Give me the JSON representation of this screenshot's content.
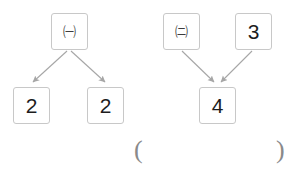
{
  "diagram": {
    "type": "arrow-decomposition-diagram",
    "colors": {
      "box_border": "#c8c8c8",
      "arrow": "#a6a6a6",
      "digit_text": "#1d1d1d",
      "circled_text": "#3c3c3c",
      "paren_text": "#8a8a8a",
      "background": "#ffffff"
    },
    "left_group": {
      "name": "left-decomposition",
      "parent": {
        "label": "㈠",
        "icon_name": "circled-korean-giyeok",
        "kind": "circled-letter"
      },
      "children": [
        {
          "label": "2",
          "kind": "digit"
        },
        {
          "label": "2",
          "kind": "digit"
        }
      ],
      "arrows": [
        {
          "from": "parent",
          "to": "child-1",
          "direction": "down-left"
        },
        {
          "from": "parent",
          "to": "child-2",
          "direction": "down-right"
        }
      ]
    },
    "right_group": {
      "name": "right-composition",
      "parents": [
        {
          "label": "㈡",
          "icon_name": "circled-korean-nieun",
          "kind": "circled-letter"
        },
        {
          "label": "3",
          "kind": "digit"
        }
      ],
      "child": {
        "label": "4",
        "kind": "digit"
      },
      "arrows": [
        {
          "from": "parent-1",
          "to": "child",
          "direction": "down-right"
        },
        {
          "from": "parent-2",
          "to": "child",
          "direction": "down-left"
        }
      ]
    },
    "answer_blank": {
      "open": "(",
      "close": ")",
      "value": ""
    }
  }
}
